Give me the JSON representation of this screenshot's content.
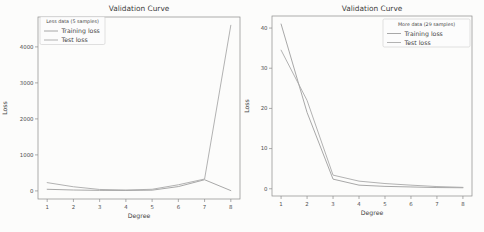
{
  "figure": {
    "colors": {
      "background": "#fcfcfb",
      "title_text": "#3d3d3d",
      "text": "#474747",
      "tick_text": "#4f4f4f",
      "spine": "#8b8b8b",
      "legend_border": "#cccccc",
      "training_line": "#9e9e9e",
      "test_line": "#a9a9a9"
    }
  },
  "chart_data": [
    {
      "type": "line",
      "title": "Validation Curve",
      "xlabel": "Degree",
      "ylabel": "Loss",
      "x": [
        1,
        2,
        3,
        4,
        5,
        6,
        7,
        8
      ],
      "xticks": [
        1,
        2,
        3,
        4,
        5,
        6,
        7,
        8
      ],
      "yticks": [
        0,
        1000,
        2000,
        3000,
        4000
      ],
      "xlim": [
        0.65,
        8.35
      ],
      "ylim": [
        -225,
        4830
      ],
      "grid": false,
      "legend": {
        "title": "Less data (5 samples)",
        "position": "top-left"
      },
      "series": [
        {
          "name": "Training loss",
          "color": "#9e9e9e",
          "values": [
            45,
            25,
            15,
            12,
            20,
            120,
            310,
            8
          ]
        },
        {
          "name": "Test loss",
          "color": "#a9a9a9",
          "values": [
            230,
            115,
            40,
            25,
            45,
            170,
            330,
            4600
          ]
        }
      ]
    },
    {
      "type": "line",
      "title": "Validation Curve",
      "xlabel": "Degree",
      "ylabel": "Loss",
      "x": [
        1,
        2,
        3,
        4,
        5,
        6,
        7,
        8
      ],
      "xticks": [
        1,
        2,
        3,
        4,
        5,
        6,
        7,
        8
      ],
      "yticks": [
        0,
        10,
        20,
        30,
        40
      ],
      "xlim": [
        0.65,
        8.35
      ],
      "ylim": [
        -1.8,
        43.0
      ],
      "grid": false,
      "legend": {
        "title": "More data (29 samples)",
        "position": "top-right"
      },
      "series": [
        {
          "name": "Training loss",
          "color": "#9e9e9e",
          "values": [
            41,
            19,
            2.4,
            0.9,
            0.6,
            0.45,
            0.3,
            0.25
          ]
        },
        {
          "name": "Test loss",
          "color": "#a9a9a9",
          "values": [
            34.5,
            22,
            3.4,
            1.9,
            1.3,
            0.9,
            0.55,
            0.35
          ]
        }
      ]
    }
  ]
}
